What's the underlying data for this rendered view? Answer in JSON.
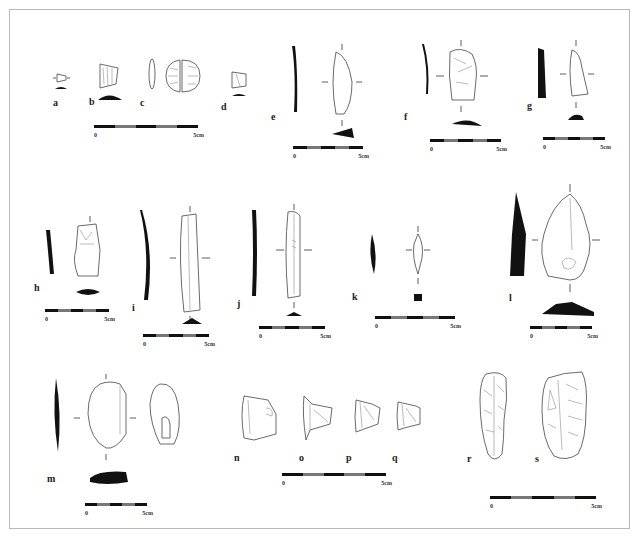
{
  "figure": {
    "type": "archaeological lithic artifact plate",
    "artifacts": [
      {
        "id": "a",
        "label": "a"
      },
      {
        "id": "b",
        "label": "b"
      },
      {
        "id": "c",
        "label": "c"
      },
      {
        "id": "d",
        "label": "d"
      },
      {
        "id": "e",
        "label": "e"
      },
      {
        "id": "f",
        "label": "f"
      },
      {
        "id": "g",
        "label": "g"
      },
      {
        "id": "h",
        "label": "h"
      },
      {
        "id": "i",
        "label": "i"
      },
      {
        "id": "j",
        "label": "j"
      },
      {
        "id": "k",
        "label": "k"
      },
      {
        "id": "l",
        "label": "l"
      },
      {
        "id": "m",
        "label": "m"
      },
      {
        "id": "n",
        "label": "n"
      },
      {
        "id": "o",
        "label": "o"
      },
      {
        "id": "p",
        "label": "p"
      },
      {
        "id": "q",
        "label": "q"
      },
      {
        "id": "r",
        "label": "r"
      },
      {
        "id": "s",
        "label": "s"
      }
    ],
    "scale_bars": [
      {
        "id": "abcd",
        "start": "0",
        "end": "5cm"
      },
      {
        "id": "e",
        "start": "0",
        "end": "5cm"
      },
      {
        "id": "f",
        "start": "0",
        "end": "5cm"
      },
      {
        "id": "g",
        "start": "0",
        "end": "5cm"
      },
      {
        "id": "h",
        "start": "0",
        "end": "5cm"
      },
      {
        "id": "i",
        "start": "0",
        "end": "5cm"
      },
      {
        "id": "j",
        "start": "0",
        "end": "5cm"
      },
      {
        "id": "k",
        "start": "0",
        "end": "5cm"
      },
      {
        "id": "l",
        "start": "0",
        "end": "5cm"
      },
      {
        "id": "m",
        "start": "0",
        "end": "5cm"
      },
      {
        "id": "nopq",
        "start": "0",
        "end": "5cm"
      },
      {
        "id": "rs",
        "start": "0",
        "end": "5cm"
      }
    ],
    "colors": {
      "ink": "#111111",
      "outline": "#444444",
      "frame": "#b9b9b9",
      "background": "#ffffff"
    }
  }
}
